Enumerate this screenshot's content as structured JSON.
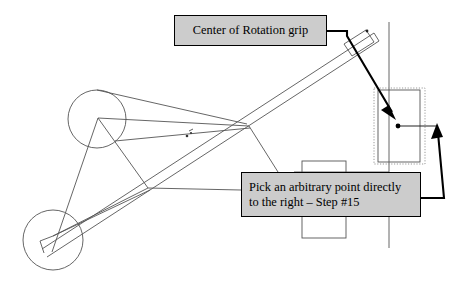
{
  "document": {
    "kind": "cad-mechanism-tutorial-diagram",
    "background_color": "#ffffff",
    "width": 462,
    "height": 296
  },
  "callouts": [
    {
      "id": "center-of-rotation-grip",
      "text": "Center of Rotation grip",
      "fill_color": "#cccccc",
      "border_color": "#000000"
    },
    {
      "id": "arbitrary-point-step-15",
      "text": "Pick an arbitrary point directly\nto the right – Step #15",
      "fill_color": "#cccccc",
      "border_color": "#000000"
    }
  ],
  "geometry": {
    "stroke_color": "#555555",
    "heavy_stroke_color": "#000000",
    "selection_color": "#999999",
    "circles": [
      {
        "name": "upper-pivot-circle",
        "cx": 97,
        "cy": 119,
        "r": 29
      },
      {
        "name": "lower-pivot-circle",
        "cx": 53,
        "cy": 240,
        "r": 30
      }
    ],
    "linkage_lines": [
      {
        "name": "link-upper-top-to-right",
        "x1": 97,
        "y1": 90,
        "x2": 247,
        "y2": 124
      },
      {
        "name": "link-upper-vertex-to-right",
        "x1": 98,
        "y1": 118,
        "x2": 249,
        "y2": 126
      },
      {
        "name": "link-upper-vertex-down-left",
        "x1": 98,
        "y1": 118,
        "x2": 52,
        "y2": 252
      },
      {
        "name": "link-upper-vertex-down-right",
        "x1": 98,
        "y1": 118,
        "x2": 148,
        "y2": 188
      },
      {
        "name": "link-crossbar-to-lower",
        "x1": 148,
        "y1": 188,
        "x2": 53,
        "y2": 236
      },
      {
        "name": "link-lower-to-crossbar",
        "x1": 53,
        "y1": 236,
        "x2": 150,
        "y2": 190
      },
      {
        "name": "link-upper-circle-edge-to-right",
        "x1": 115,
        "y1": 141,
        "x2": 250,
        "y2": 128
      }
    ],
    "beam": {
      "name": "main-diagonal-beam",
      "edge_a": {
        "x1": 42,
        "y1": 249,
        "x2": 374,
        "y2": 33
      },
      "edge_b": {
        "x1": 47,
        "y1": 257,
        "x2": 379,
        "y2": 41
      },
      "cap": {
        "x1": 374,
        "y1": 33,
        "x2": 379,
        "y2": 41
      },
      "grip_handle": {
        "name": "rotation-grip-handle",
        "points": "366,30 374,42 352,56 344,44"
      },
      "mid_marker": {
        "cx": 189,
        "cy": 134
      }
    },
    "branch_line": {
      "name": "beam-to-base-link",
      "x1": 249,
      "y1": 126,
      "x2": 278,
      "y2": 172
    },
    "vertical_rail": {
      "name": "vertical-guide-rail",
      "x1": 389,
      "y1": 22,
      "x2": 389,
      "y2": 248
    },
    "horizontal_rail": {
      "name": "horizontal-base-rail",
      "x1": 294,
      "y1": 172,
      "x2": 389,
      "y2": 172
    },
    "base_blocks": [
      {
        "name": "base-block-upper",
        "x": 302,
        "y": 161,
        "width": 44,
        "height": 12
      },
      {
        "name": "base-block-lower",
        "x": 302,
        "y": 216,
        "width": 44,
        "height": 22
      }
    ],
    "selection_box": {
      "name": "selection-highlight-box",
      "x": 374,
      "y": 88,
      "width": 51,
      "height": 76
    },
    "inner_rect": {
      "name": "selected-rectangle",
      "x": 378,
      "y": 90,
      "width": 42,
      "height": 72
    },
    "picked_point": {
      "name": "picked-point-dot",
      "cx": 398,
      "cy": 126,
      "r": 2.4
    },
    "point_ray": {
      "name": "picked-point-ray",
      "x1": 398,
      "y1": 126,
      "x2": 437,
      "y2": 126
    }
  },
  "leaders": [
    {
      "name": "leader-rotation-grip",
      "path": "M 327,31 L 347,31 L 347,36 L 395,115",
      "arrow_points": "395,120 384,108 389,104",
      "stroke_color": "#000000"
    },
    {
      "name": "leader-arbitrary-point-right",
      "path": "M 421,198 L 443,198 L 437,129",
      "arrow_points": "436,124 431,139 442,138",
      "stroke_color": "#000000"
    },
    {
      "name": "leader-arbitrary-point-left",
      "path": "M 241,190 L 148,188",
      "arrow_points": "",
      "stroke_color": "#555555"
    }
  ]
}
